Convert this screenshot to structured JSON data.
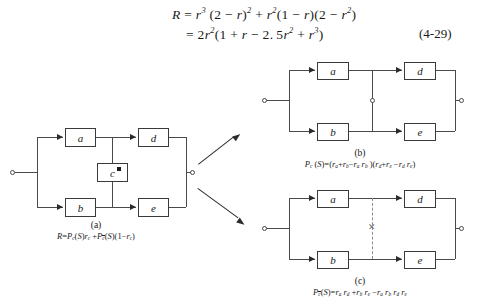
{
  "equation": {
    "line1": "R = r³(2 − r)² + r²(1 − r)(2 − r²)",
    "line2": "= 2r²(1 + r − 2.5r² + r³)",
    "number": "(4-29)"
  },
  "figure_a": {
    "label": "(a)",
    "formula": "R=Pc(S)rc +Pc̄(S)(1−rc)",
    "blocks": [
      {
        "id": "a",
        "label": "a"
      },
      {
        "id": "b",
        "label": "b"
      },
      {
        "id": "c",
        "label": "c"
      },
      {
        "id": "d",
        "label": "d"
      },
      {
        "id": "e",
        "label": "e"
      }
    ],
    "bridge_state": "intact"
  },
  "figure_b": {
    "label": "(b)",
    "formula": "Pc(S)=(ra+rb−ra rb)(rd+re−rd re)",
    "blocks": [
      {
        "id": "a",
        "label": "a"
      },
      {
        "id": "b",
        "label": "b"
      },
      {
        "id": "d",
        "label": "d"
      },
      {
        "id": "e",
        "label": "e"
      }
    ],
    "bridge_state": "shorted"
  },
  "figure_c": {
    "label": "(c)",
    "formula": "Pc̄(S)=ra rd +rb re −ra rb rd re",
    "blocks": [
      {
        "id": "a",
        "label": "a"
      },
      {
        "id": "b",
        "label": "b"
      },
      {
        "id": "d",
        "label": "d"
      },
      {
        "id": "e",
        "label": "e"
      }
    ],
    "bridge_state": "open",
    "open_marker": "✕"
  }
}
